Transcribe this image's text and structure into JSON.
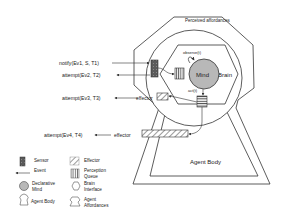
{
  "diagram": {
    "perceived_affordances_label": "Perceived affordances",
    "mind_label": "Mind",
    "brain_label": "Brain",
    "observe_label": "observe(t)",
    "act_label": "act(t)",
    "agent_body_label": "Agent Body",
    "events": [
      {
        "label": "notify(Ev1, S, T1)",
        "direction": "in"
      },
      {
        "label": "attempt(Ev2, T2)",
        "direction": "out"
      },
      {
        "label": "attempt(Ev3, T3)",
        "direction": "out",
        "via": "effector"
      },
      {
        "label": "attempt(Ev4, T4)",
        "direction": "out",
        "via": "effector"
      }
    ],
    "effector_label_1": "effector",
    "effector_label_2": "effector"
  },
  "legend": {
    "items": [
      {
        "icon": "sensor-icon",
        "label": "Sensor"
      },
      {
        "icon": "effector-icon",
        "label": "Effector"
      },
      {
        "icon": "event-arrow-icon",
        "label": "Event"
      },
      {
        "icon": "perception-queue-icon",
        "label_line1": "Perception",
        "label_line2": "Queue"
      },
      {
        "icon": "declarative-mind-icon",
        "label_line1": "Declarative",
        "label_line2": "Mind"
      },
      {
        "icon": "brain-interface-icon",
        "label_line1": "Brain",
        "label_line2": "Interface"
      },
      {
        "icon": "agent-body-icon",
        "label": "Agent Body"
      },
      {
        "icon": "agent-affordances-icon",
        "label_line1": "Agent",
        "label_line2": "Affordances"
      }
    ]
  },
  "colors": {
    "line": "#333333",
    "mind_fill": "#b8b8b8",
    "sensor_fill": "#555555"
  }
}
